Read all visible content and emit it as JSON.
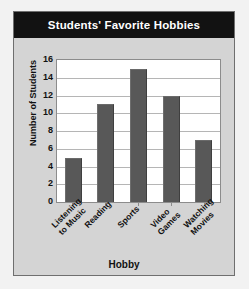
{
  "panel": {
    "title": "Students' Favorite Hobbies",
    "title_bar_color": "#121212",
    "title_text_color": "#ffffff",
    "background_color": "#d4d4d4",
    "border_color": "#6f6f6f"
  },
  "chart_data": {
    "type": "bar",
    "title": "Students' Favorite Hobbies",
    "categories": [
      "Listening to Music",
      "Reading",
      "Sports",
      "Video Games",
      "Watching Movies"
    ],
    "category_lines": [
      [
        "Listening",
        "to Music"
      ],
      [
        "Reading",
        ""
      ],
      [
        "Sports",
        ""
      ],
      [
        "Video",
        "Games"
      ],
      [
        "Watching",
        "Movies"
      ]
    ],
    "values": [
      5,
      11,
      15,
      12,
      7
    ],
    "xlabel": "Hobby",
    "ylabel": "Number of Students",
    "ylim": [
      0,
      16
    ],
    "ytick_step": 2,
    "yticks": [
      0,
      2,
      4,
      6,
      8,
      10,
      12,
      14,
      16
    ],
    "grid": true,
    "grid_axis": "y",
    "legend": false,
    "bar_color": "#585858",
    "grid_color": "#b5b5b5",
    "plot_background": "#ffffff",
    "axis_color": "#8c8c8c",
    "xlabel_rotation": -45
  }
}
